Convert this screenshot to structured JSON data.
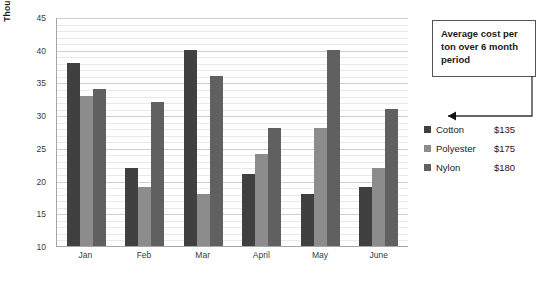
{
  "chart_data": {
    "type": "bar",
    "title": "",
    "xlabel": "",
    "ylabel": "Thousands of tons imported",
    "categories": [
      "Jan",
      "Feb",
      "Mar",
      "April",
      "May",
      "June"
    ],
    "series": [
      {
        "name": "Cotton",
        "color": "#404040",
        "values": [
          38,
          22,
          40,
          21,
          18,
          19
        ]
      },
      {
        "name": "Polyester",
        "color": "#8c8c8c",
        "values": [
          33,
          19,
          18,
          24,
          28,
          22
        ]
      },
      {
        "name": "Nylon",
        "color": "#606060",
        "values": [
          34,
          32,
          36,
          28,
          40,
          31
        ]
      }
    ],
    "ylim": [
      10,
      45
    ],
    "yticks": [
      10,
      15,
      20,
      25,
      30,
      35,
      40,
      45
    ],
    "ytick_step": 5,
    "minor_gridline_step": 1,
    "grid": true,
    "legend_position": "right"
  },
  "callout": {
    "text": "Average cost per ton over 6 month period"
  },
  "legend": {
    "rows": [
      {
        "name": "Cotton",
        "price": "$135",
        "color": "#404040"
      },
      {
        "name": "Polyester",
        "price": "$175",
        "color": "#8c8c8c"
      },
      {
        "name": "Nylon",
        "price": "$180",
        "color": "#606060"
      }
    ]
  }
}
